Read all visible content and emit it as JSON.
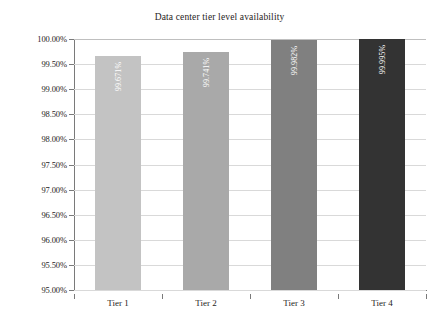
{
  "chart_data": {
    "type": "bar",
    "title": "Data center tier level availability",
    "xlabel": "",
    "ylabel": "",
    "categories": [
      "Tier 1",
      "Tier 2",
      "Tier 3",
      "Tier 4"
    ],
    "values": [
      99.671,
      99.741,
      99.982,
      99.995
    ],
    "data_labels": [
      "99.671%",
      "99.741%",
      "99.982%",
      "99.995%"
    ],
    "bar_colors": [
      "#c3c3c3",
      "#a9a9a9",
      "#808080",
      "#333333"
    ],
    "ylim": [
      95.0,
      100.0
    ],
    "ytick_step": 0.5,
    "ytick_labels": [
      "100.00%",
      "99.50%",
      "99.00%",
      "98.50%",
      "98.00%",
      "97.50%",
      "97.00%",
      "96.50%",
      "96.00%",
      "95.50%",
      "95.00%"
    ],
    "ytick_values": [
      100.0,
      99.5,
      99.0,
      98.5,
      98.0,
      97.5,
      97.0,
      96.5,
      96.0,
      95.5,
      95.0
    ],
    "grid": true,
    "grid_orientation": "horizontal",
    "legend": false,
    "legend_position": "none",
    "data_label_rotation": -90,
    "data_label_color": "#ffffff",
    "background_color": "#ffffff",
    "axis_color": "#7a7a7a",
    "gridline_color": "#d9d9d9"
  }
}
